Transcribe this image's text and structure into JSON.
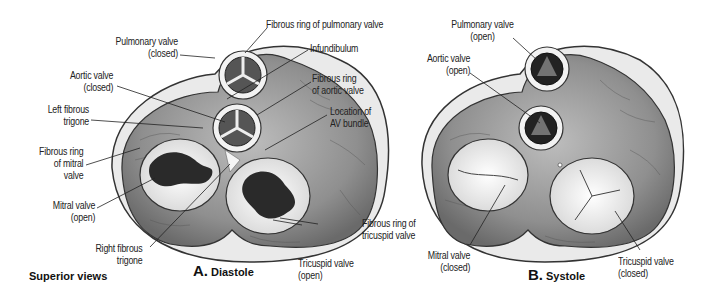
{
  "caption": "Superior views",
  "panels": [
    {
      "letter": "A.",
      "title": "Diastole",
      "labels": {
        "fibrous_ring_pulmonary": "Fibrous ring of pulmonary valve",
        "pulmonary_valve": [
          "Pulmonary valve",
          "(closed)"
        ],
        "infundibulum": "Infundibulum",
        "aortic_valve": [
          "Aortic valve",
          "(closed)"
        ],
        "fibrous_ring_aortic": [
          "Fibrous ring",
          "of aortic valve"
        ],
        "left_fibrous_trigone": [
          "Left fibrous",
          "trigone"
        ],
        "location_av_bundle": [
          "Location of",
          "AV bundle"
        ],
        "fibrous_ring_mitral": [
          "Fibrous ring",
          "of mitral",
          "valve"
        ],
        "mitral_valve": [
          "Mitral valve",
          "(open)"
        ],
        "right_fibrous_trigone": [
          "Right fibrous",
          "trigone"
        ],
        "tricuspid_valve": [
          "Tricuspid valve",
          "(open)"
        ],
        "fibrous_ring_tricuspid": [
          "Fibrous ring of",
          "tricuspid valve"
        ]
      }
    },
    {
      "letter": "B.",
      "title": "Systole",
      "labels": {
        "pulmonary_valve": [
          "Pulmonary valve",
          "(open)"
        ],
        "aortic_valve": [
          "Aortic valve",
          "(open)"
        ],
        "mitral_valve": [
          "Mitral valve",
          "(closed)"
        ],
        "tricuspid_valve": [
          "Tricuspid valve",
          "(closed)"
        ]
      }
    }
  ],
  "colors": {
    "muscle": "#9a9a9a",
    "muscle_dark": "#6e6e6e",
    "ring": "#f2f2f2",
    "outline": "#333333",
    "orifice": "#f7f7f7",
    "leaflet_dark": "#2a2a2a"
  }
}
